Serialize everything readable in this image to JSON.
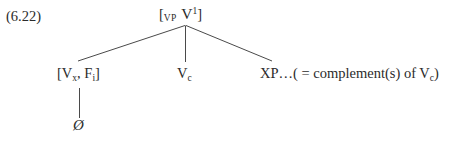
{
  "figure": {
    "example_number": "(6.22)",
    "type": "syntactic-tree-diagram",
    "root": {
      "bracket_open": "[",
      "category_subscript": "VP",
      "head_symbol": "V",
      "head_superscript": "1",
      "bracket_close": "]"
    },
    "branches": [
      {
        "name": "specifier",
        "label_parts": {
          "bracket_open": "[",
          "first_symbol": "V",
          "first_subscript": "x",
          "separator": ", ",
          "second_symbol": "F",
          "second_subscript": "i",
          "bracket_close": "]"
        }
      },
      {
        "name": "head",
        "label_parts": {
          "symbol": "V",
          "subscript": "c"
        }
      },
      {
        "name": "complement",
        "label_parts": {
          "lead": "XP…( = complement(s) of ",
          "symbol": "V",
          "subscript": "c",
          "tail": ")"
        }
      }
    ],
    "terminal": {
      "name": "null-element",
      "glyph": "Ø"
    },
    "colors": {
      "background": "#ffffff",
      "text": "#2b2b2b",
      "line": "#4a4a4a"
    }
  }
}
